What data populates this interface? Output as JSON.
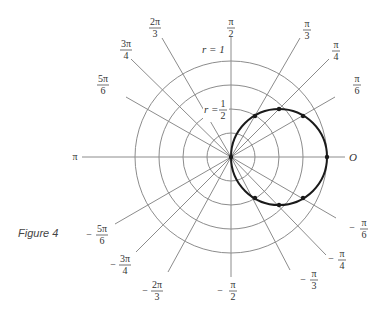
{
  "figure": {
    "caption": "Figure 4",
    "origin_label": "O",
    "ring_labels": {
      "r1": "r = 1",
      "r_half_prefix": "r =",
      "r_half_num": "1",
      "r_half_den": "2"
    },
    "angle_labels": [
      {
        "id": "pi_over_2",
        "sign": "",
        "num": "π",
        "den": "2"
      },
      {
        "id": "2pi_over_3",
        "sign": "",
        "num": "2π",
        "den": "3"
      },
      {
        "id": "3pi_over_4",
        "sign": "",
        "num": "3π",
        "den": "4"
      },
      {
        "id": "5pi_over_6",
        "sign": "",
        "num": "5π",
        "den": "6"
      },
      {
        "id": "pi",
        "sign": "",
        "num": "π",
        "den": ""
      },
      {
        "id": "pi_over_3",
        "sign": "",
        "num": "π",
        "den": "3"
      },
      {
        "id": "pi_over_4",
        "sign": "",
        "num": "π",
        "den": "4"
      },
      {
        "id": "pi_over_6",
        "sign": "",
        "num": "π",
        "den": "6"
      },
      {
        "id": "neg_pi_over_6",
        "sign": "−",
        "num": "π",
        "den": "6"
      },
      {
        "id": "neg_pi_over_4",
        "sign": "−",
        "num": "π",
        "den": "4"
      },
      {
        "id": "neg_pi_over_3",
        "sign": "−",
        "num": "π",
        "den": "3"
      },
      {
        "id": "neg_pi_over_2",
        "sign": "−",
        "num": "π",
        "den": "2"
      },
      {
        "id": "neg_2pi_over_3",
        "sign": "−",
        "num": "2π",
        "den": "3"
      },
      {
        "id": "neg_3pi_over_4",
        "sign": "−",
        "num": "3π",
        "den": "4"
      },
      {
        "id": "neg_5pi_over_6",
        "sign": "−",
        "num": "5π",
        "den": "6"
      }
    ],
    "polar_grid": {
      "rings_r": [
        0.25,
        0.5,
        0.75,
        1.0
      ]
    },
    "curve": {
      "equation": "r = cos θ",
      "marked_points_count": 7
    }
  }
}
